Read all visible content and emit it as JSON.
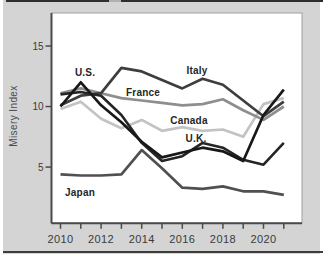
{
  "card": {
    "background": "#d4d4d4",
    "top_border_color": "#2d2d2d",
    "bottom_border_color": "#3e3e3e"
  },
  "chart_data": {
    "type": "line",
    "title": "",
    "xlabel": "",
    "ylabel": "Misery Index",
    "x": [
      2010,
      2011,
      2012,
      2013,
      2014,
      2015,
      2016,
      2017,
      2018,
      2019,
      2020,
      2021
    ],
    "x_tick_labels": [
      "2010",
      "2012",
      "2014",
      "2016",
      "2018",
      "2020"
    ],
    "y_ticks": [
      5,
      10,
      15
    ],
    "y_tick_labels": [
      "5",
      "10",
      "15"
    ],
    "ylim": [
      0.3,
      17.7
    ],
    "xlim": [
      2009.6,
      2021.9
    ],
    "grid": false,
    "legend": "inline-labels",
    "plot_background": "#ffffff",
    "axis_color": "#4a4a4a",
    "tick_text_color": "#3a3a3a",
    "series": [
      {
        "name": "Canada",
        "color": "#c3c3c3",
        "width": 2.7,
        "values": [
          9.8,
          10.4,
          9.0,
          8.2,
          8.9,
          8.0,
          8.3,
          8.0,
          8.1,
          7.5,
          10.2,
          10.7
        ],
        "label_x": 189,
        "label_y": 124
      },
      {
        "name": "France",
        "color": "#8e8e8e",
        "width": 2.7,
        "values": [
          11.1,
          11.5,
          11.1,
          10.7,
          10.5,
          10.3,
          10.1,
          10.2,
          10.6,
          9.7,
          8.9,
          10.0
        ],
        "label_x": 143,
        "label_y": 96
      },
      {
        "name": "Italy",
        "color": "#3e3e3e",
        "width": 2.7,
        "values": [
          10.1,
          10.9,
          11.1,
          13.2,
          12.9,
          12.2,
          11.5,
          12.3,
          11.8,
          10.5,
          9.2,
          10.4
        ],
        "label_x": 197,
        "label_y": 74
      },
      {
        "name": "Japan",
        "color": "#505050",
        "width": 2.7,
        "values": [
          4.4,
          4.3,
          4.3,
          4.4,
          6.4,
          4.9,
          3.3,
          3.2,
          3.4,
          3.0,
          3.0,
          2.7
        ],
        "label_x": 80,
        "label_y": 196
      },
      {
        "name": "U.K.",
        "color": "#252525",
        "width": 2.6,
        "values": [
          11.0,
          11.2,
          10.9,
          9.3,
          7.0,
          5.5,
          5.9,
          7.0,
          6.6,
          5.6,
          5.2,
          7.0
        ],
        "label_x": 196,
        "label_y": 142
      },
      {
        "name": "U.S.",
        "color": "#181818",
        "width": 2.7,
        "values": [
          10.0,
          12.0,
          10.1,
          8.7,
          7.1,
          5.8,
          6.2,
          6.6,
          6.3,
          5.5,
          9.3,
          11.4
        ],
        "label_x": 85,
        "label_y": 76
      }
    ]
  }
}
